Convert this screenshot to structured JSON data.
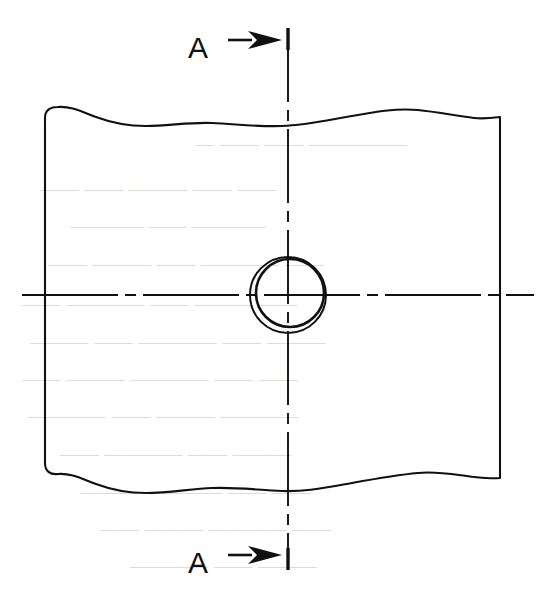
{
  "drawing": {
    "title": "Sectioned view of a plate with a through hole",
    "background_color": "#ffffff",
    "line_color": "#111111",
    "ghost_text_color": "#d9d6d0",
    "section_markers": [
      {
        "id": "top",
        "label": "A",
        "label_x": 198,
        "label_y": 50,
        "arrow_tail_x": 228,
        "arrow_tip_x": 282,
        "arrow_y": 40,
        "icon": "arrow-right-icon"
      },
      {
        "id": "bottom",
        "label": "A",
        "label_x": 198,
        "label_y": 565,
        "arrow_tail_x": 228,
        "arrow_tip_x": 282,
        "arrow_y": 555,
        "icon": "arrow-right-icon"
      }
    ],
    "cutting_plane_line": {
      "name": "vertical-cutting-plane-line",
      "x": 288,
      "y_start": 28,
      "y_end": 570,
      "style": "long-dash-short-dash",
      "end_cap_length": 22
    },
    "center_line_horizontal": {
      "name": "horizontal-center-line",
      "y": 295,
      "x_start": 22,
      "x_end": 534,
      "style": "long-dash-short-dash"
    },
    "hole": {
      "name": "through-hole",
      "center_x": 288,
      "center_y": 295,
      "outer_radius": 38,
      "inner_radius": 34,
      "inner_offset_x": 2,
      "inner_offset_y": -2
    },
    "plate_outline": {
      "name": "plate-body-with-break-lines",
      "left_edge_x": 45,
      "right_edge_x": 500,
      "top_edge_y": 108,
      "bottom_edge_y": 478,
      "top_break": "wavy",
      "bottom_break": "wavy"
    },
    "ghost_text": {
      "note": "faint show-through text from reverse side of page, illegible",
      "lines": [
        {
          "x": 195,
          "y": 150,
          "size": 19,
          "text": "— —— —— —————"
        },
        {
          "x": 40,
          "y": 195,
          "size": 19,
          "text": "—— —— ——— —— ——"
        },
        {
          "x": 70,
          "y": 232,
          "size": 18,
          "text": "———— —— ————"
        },
        {
          "x": 48,
          "y": 270,
          "size": 19,
          "text": "—— ——— —— ———— ——"
        },
        {
          "x": 22,
          "y": 310,
          "size": 19,
          "text": "—— ———— —— ——— ——"
        },
        {
          "x": 30,
          "y": 348,
          "size": 19,
          "text": "——— —— ———— —— ———"
        },
        {
          "x": 22,
          "y": 385,
          "size": 19,
          "text": "—— ——— ———— —— ——"
        },
        {
          "x": 28,
          "y": 422,
          "size": 19,
          "text": "———— —— ——— ————"
        },
        {
          "x": 60,
          "y": 460,
          "size": 19,
          "text": "—— ———— —— ———"
        },
        {
          "x": 80,
          "y": 498,
          "size": 19,
          "text": "——— ———— —— ——"
        },
        {
          "x": 100,
          "y": 535,
          "size": 19,
          "text": "—— ——— ———— ——"
        },
        {
          "x": 130,
          "y": 572,
          "size": 19,
          "text": "———— —— ———"
        }
      ]
    }
  }
}
